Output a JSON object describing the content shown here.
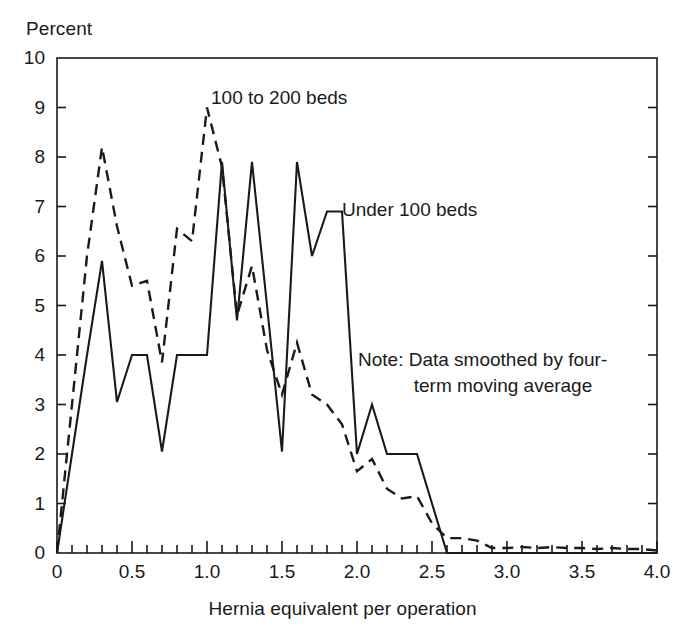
{
  "chart_data": {
    "type": "line",
    "title": "",
    "xlabel": "Hernia equivalent per operation",
    "ylabel": "Percent",
    "xlim": [
      0,
      4.0
    ],
    "ylim": [
      0,
      10
    ],
    "grid": false,
    "legend_position": "inline-annotations",
    "x_major_ticks": [
      "0",
      "0.5",
      "1.0",
      "1.5",
      "2.0",
      "2.5",
      "3.0",
      "3.5",
      "4.0"
    ],
    "x_major_values": [
      0,
      0.5,
      1.0,
      1.5,
      2.0,
      2.5,
      3.0,
      3.5,
      4.0
    ],
    "x_minor_step": 0.1,
    "y_major_ticks": [
      "0",
      "1",
      "2",
      "3",
      "4",
      "5",
      "6",
      "7",
      "8",
      "9",
      "10"
    ],
    "y_major_values": [
      0,
      1,
      2,
      3,
      4,
      5,
      6,
      7,
      8,
      9,
      10
    ],
    "annotations": [
      {
        "name": "note",
        "line1": "Note: Data smoothed by four-",
        "line2": "term moving average"
      }
    ],
    "series": [
      {
        "name": "Under 100 beds",
        "style": "solid",
        "color": "#1a1a1a",
        "x": [
          0.0,
          0.1,
          0.2,
          0.3,
          0.4,
          0.5,
          0.6,
          0.7,
          0.8,
          0.9,
          1.0,
          1.1,
          1.2,
          1.3,
          1.4,
          1.5,
          1.6,
          1.7,
          1.8,
          1.9,
          2.0,
          2.1,
          2.2,
          2.3,
          2.4,
          2.5,
          2.6,
          2.7,
          2.8,
          2.9,
          3.0,
          3.2,
          3.4,
          3.6,
          3.8,
          4.0
        ],
        "values": [
          0.0,
          2.0,
          4.0,
          5.9,
          3.05,
          4.0,
          4.0,
          2.05,
          4.0,
          4.0,
          4.0,
          7.9,
          4.7,
          7.9,
          5.0,
          2.05,
          7.9,
          6.0,
          6.9,
          6.9,
          2.0,
          3.0,
          2.0,
          2.0,
          2.0,
          1.0,
          0.0,
          0.0,
          0.0,
          0.0,
          0.0,
          0.0,
          0.0,
          0.0,
          0.0,
          0.0
        ]
      },
      {
        "name": "100 to 200 beds",
        "style": "dashed",
        "color": "#1a1a1a",
        "x": [
          0.0,
          0.1,
          0.2,
          0.3,
          0.4,
          0.5,
          0.6,
          0.7,
          0.8,
          0.9,
          1.0,
          1.1,
          1.2,
          1.3,
          1.4,
          1.5,
          1.6,
          1.7,
          1.8,
          1.9,
          2.0,
          2.1,
          2.2,
          2.3,
          2.4,
          2.5,
          2.6,
          2.7,
          2.8,
          2.9,
          3.0,
          3.1,
          3.2,
          3.3,
          3.4,
          3.5,
          3.6,
          3.7,
          3.8,
          3.9,
          4.0
        ],
        "values": [
          0.0,
          3.0,
          6.0,
          8.2,
          6.6,
          5.4,
          5.5,
          3.85,
          6.55,
          6.3,
          9.0,
          7.8,
          4.8,
          5.8,
          4.1,
          3.2,
          4.25,
          3.2,
          3.0,
          2.6,
          1.65,
          1.9,
          1.3,
          1.1,
          1.15,
          0.6,
          0.3,
          0.3,
          0.25,
          0.1,
          0.1,
          0.12,
          0.1,
          0.12,
          0.1,
          0.1,
          0.08,
          0.1,
          0.08,
          0.08,
          0.05
        ]
      }
    ]
  },
  "labels": {
    "series_100_200": "100 to 200 beds",
    "series_under_100": "Under 100 beds",
    "y_axis_title": "Percent",
    "x_axis_title": "Hernia equivalent per operation",
    "note_line_1": "Note: Data smoothed by four-",
    "note_line_2": "term moving average"
  },
  "colors": {
    "line": "#1a1a1a",
    "axis": "#1a1a1a",
    "background": "#ffffff"
  }
}
